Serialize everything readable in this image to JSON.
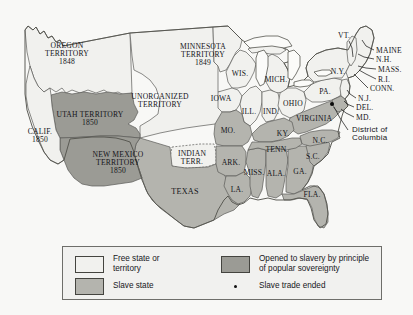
{
  "map": {
    "title": "United States 1850 slave and free states map",
    "colors": {
      "free": "#f1f1ee",
      "slave": "#b4b4ae",
      "popular_sovereignty": "#9b9b95",
      "background": "#f8f8f6",
      "outline": "#55554f",
      "text": "#15151a"
    },
    "labels": [
      {
        "name": "oregon-territory",
        "text": "OREGON\nTERRITORY\n1848",
        "x": 67,
        "y": 54,
        "size": 7.6
      },
      {
        "name": "utah-territory",
        "text": "UTAH TERRITORY\n1850",
        "x": 90,
        "y": 119,
        "size": 7.6
      },
      {
        "name": "california",
        "text": "CALIF.\n1850",
        "x": 40,
        "y": 136,
        "size": 7.6
      },
      {
        "name": "new-mexico-territory",
        "text": "NEW MEXICO\nTERRITORY\n1850",
        "x": 118,
        "y": 163,
        "size": 7.6
      },
      {
        "name": "unorganized-territory",
        "text": "UNORGANIZED\nTERRITORY",
        "x": 160,
        "y": 101,
        "size": 7.6
      },
      {
        "name": "minnesota-territory",
        "text": "MINNESOTA\nTERRITORY\n1849",
        "x": 203,
        "y": 55,
        "size": 7.6
      },
      {
        "name": "wisconsin",
        "text": "WIS.",
        "x": 240,
        "y": 74,
        "size": 7.6
      },
      {
        "name": "iowa",
        "text": "IOWA",
        "x": 221,
        "y": 99,
        "size": 7.6
      },
      {
        "name": "illinois",
        "text": "ILL.",
        "x": 249,
        "y": 112,
        "size": 7.6
      },
      {
        "name": "indiana",
        "text": "IND.",
        "x": 271,
        "y": 112,
        "size": 7.6
      },
      {
        "name": "michigan",
        "text": "MICH.",
        "x": 276,
        "y": 80,
        "size": 7.6
      },
      {
        "name": "ohio",
        "text": "OHIO",
        "x": 293,
        "y": 104,
        "size": 7.6
      },
      {
        "name": "missouri",
        "text": "MO.",
        "x": 228,
        "y": 131,
        "size": 7.6
      },
      {
        "name": "kentucky",
        "text": "KY.",
        "x": 283,
        "y": 134,
        "size": 7.6
      },
      {
        "name": "tennessee",
        "text": "TENN.",
        "x": 277,
        "y": 150,
        "size": 7.6
      },
      {
        "name": "arkansas",
        "text": "ARK.",
        "x": 231,
        "y": 163,
        "size": 7.6
      },
      {
        "name": "indian-territory",
        "text": "INDIAN\nTERR.",
        "x": 192,
        "y": 158,
        "size": 7.6
      },
      {
        "name": "texas",
        "text": "TEXAS",
        "x": 185,
        "y": 192,
        "size": 8.2
      },
      {
        "name": "louisiana",
        "text": "LA.",
        "x": 237,
        "y": 190,
        "size": 7.6
      },
      {
        "name": "mississippi",
        "text": "MISS.",
        "x": 254,
        "y": 173,
        "size": 7.6
      },
      {
        "name": "alabama",
        "text": "ALA.",
        "x": 276,
        "y": 174,
        "size": 7.6
      },
      {
        "name": "georgia",
        "text": "GA.",
        "x": 300,
        "y": 172,
        "size": 7.6
      },
      {
        "name": "florida",
        "text": "FLA.",
        "x": 312,
        "y": 195,
        "size": 7.6
      },
      {
        "name": "south-carolina",
        "text": "S.C.",
        "x": 313,
        "y": 157,
        "size": 7.6
      },
      {
        "name": "north-carolina",
        "text": "N.C.",
        "x": 320,
        "y": 141,
        "size": 7.6
      },
      {
        "name": "virginia",
        "text": "VIRGINIA",
        "x": 314,
        "y": 119,
        "size": 7.6
      },
      {
        "name": "pennsylvania",
        "text": "PA.",
        "x": 325,
        "y": 92,
        "size": 7.6
      },
      {
        "name": "new-york",
        "text": "N.Y.",
        "x": 338,
        "y": 72,
        "size": 7.6
      },
      {
        "name": "vermont",
        "text": "VT.",
        "x": 344,
        "y": 36,
        "size": 7.6
      }
    ],
    "leader_labels": [
      {
        "name": "maine",
        "text": "MAINE",
        "x": 376,
        "y": 51,
        "size": 7.6
      },
      {
        "name": "new-hampshire",
        "text": "N.H.",
        "x": 376,
        "y": 60,
        "size": 7.6
      },
      {
        "name": "massachusetts",
        "text": "MASS.",
        "x": 378,
        "y": 70,
        "size": 7.6
      },
      {
        "name": "rhode-island",
        "text": "R.I.",
        "x": 378,
        "y": 80,
        "size": 7.6
      },
      {
        "name": "connecticut",
        "text": "CONN.",
        "x": 370,
        "y": 89,
        "size": 7.6
      },
      {
        "name": "new-jersey",
        "text": "N.J.",
        "x": 358,
        "y": 99,
        "size": 7.6
      },
      {
        "name": "delaware",
        "text": "DEL.",
        "x": 356,
        "y": 108,
        "size": 7.6
      },
      {
        "name": "maryland",
        "text": "MD.",
        "x": 356,
        "y": 118,
        "size": 7.6
      }
    ],
    "dc": {
      "name": "district-of-columbia",
      "text": "District of\nColumbia",
      "label_x": 352,
      "label_y": 134,
      "size": 8,
      "dot_x": 332,
      "dot_y": 104
    }
  },
  "legend": {
    "items": [
      {
        "name": "legend-free-state",
        "swatch": "free",
        "label": "Free state or\nterritory"
      },
      {
        "name": "legend-slave-state",
        "swatch": "slave",
        "label": "Slave state"
      },
      {
        "name": "legend-popular-sov",
        "swatch": "popular_sovereignty",
        "label": "Opened to slavery by principle\nof popular sovereignty"
      },
      {
        "name": "legend-slave-trade",
        "swatch": "dot",
        "label": "Slave trade ended"
      }
    ]
  }
}
